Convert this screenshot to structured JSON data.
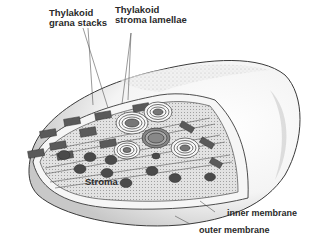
{
  "diagram": {
    "labels": {
      "grana_line1": "Thylakoid",
      "grana_line2": "grana stacks",
      "lamellae_line1": "Thylakoid",
      "lamellae_line2": "stroma lamellae",
      "stroma": "Stroma",
      "inner_membrane": "inner membrane",
      "outer_membrane": "outer membrane"
    },
    "colors": {
      "background": "#ffffff",
      "outline": "#3a3a3a",
      "membrane_fill": "#f2f2f2",
      "shading": "#bdbdbd",
      "stroma_fill": "#dcdcdc",
      "granule": "#4a4a4a",
      "label_text": "#2a2a2a"
    }
  }
}
